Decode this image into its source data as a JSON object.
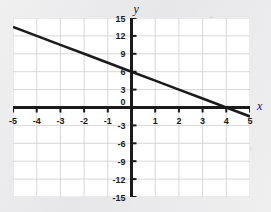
{
  "chart_data": {
    "type": "line",
    "title": "",
    "subtitle": "",
    "xlabel": "x",
    "ylabel": "y",
    "xlim": [
      -5,
      5
    ],
    "ylim": [
      -15,
      15
    ],
    "x_ticks": [
      -5,
      -4,
      -3,
      -2,
      -1,
      0,
      1,
      2,
      3,
      4,
      5
    ],
    "x_tick_labels": [
      "-5",
      "-4",
      "-3",
      "-2",
      "-1",
      "0",
      "1",
      "2",
      "3",
      "4",
      "5"
    ],
    "y_ticks": [
      -15,
      -12,
      -9,
      -6,
      -3,
      0,
      3,
      6,
      9,
      12,
      15
    ],
    "y_tick_labels": [
      "-15",
      "-12",
      "-9",
      "-6",
      "-3",
      "0",
      "3",
      "6",
      "9",
      "12",
      "15"
    ],
    "origin_label": "0",
    "grid": true,
    "grid_x_step": 1,
    "grid_y_step": 3,
    "legend": null,
    "annotations": [],
    "series": [
      {
        "name": "line",
        "equation": "y = -1.5x + 6",
        "slope": -1.5,
        "y_intercept": 6,
        "x_intercept": 4,
        "color": "#1b1b1b",
        "x": [
          -5,
          -4,
          -3,
          -2,
          -1,
          0,
          1,
          2,
          3,
          4,
          5
        ],
        "values": [
          13.5,
          12,
          10.5,
          9,
          7.5,
          6,
          4.5,
          3,
          1.5,
          0,
          -1.5
        ],
        "endpoints": [
          {
            "x": -5,
            "y": 13.5
          },
          {
            "x": 5,
            "y": -1.5
          }
        ]
      }
    ]
  },
  "colors": {
    "plot_background": "#ffffff",
    "page_background": "#ebebec",
    "grid": "#d8d8d8",
    "axis": "#1b1b1b",
    "line": "#1b1b1b"
  }
}
